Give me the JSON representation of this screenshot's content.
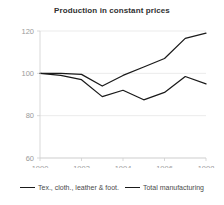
{
  "chart_data": {
    "type": "line",
    "title": "Production in constant prices",
    "xlabel": "",
    "ylabel": "",
    "x": [
      1990,
      1991,
      1992,
      1993,
      1994,
      1995,
      1996,
      1997,
      1998
    ],
    "xlim": [
      1990,
      1998
    ],
    "ylim": [
      60,
      120
    ],
    "xticks": [
      1990,
      1992,
      1994,
      1996,
      1998
    ],
    "xtick_labels": [
      "1990",
      "1992",
      "1994",
      "1996",
      "1998"
    ],
    "yticks": [
      60,
      80,
      100,
      120
    ],
    "ytick_labels": [
      "60",
      "80",
      "100",
      "120"
    ],
    "grid": true,
    "legend_position": "bottom",
    "series": [
      {
        "name": "Tex., cloth., leather & foot.",
        "color": "#1a1a1a",
        "values": [
          100,
          99,
          97,
          89,
          92,
          87.5,
          91,
          98.5,
          95
        ]
      },
      {
        "name": "Total manufacturing",
        "color": "#1a1a1a",
        "values": [
          100,
          100,
          99.5,
          94,
          99,
          103,
          107,
          116.5,
          119
        ]
      }
    ]
  },
  "legend": {
    "entries": [
      {
        "label": "Tex., cloth., leather & foot."
      },
      {
        "label": "Total manufacturing"
      }
    ]
  }
}
